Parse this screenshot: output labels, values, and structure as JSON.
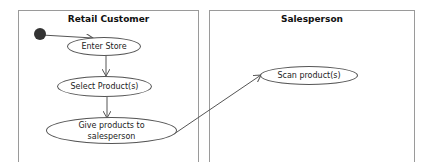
{
  "diagram": {
    "type": "UML activity diagram with swimlanes",
    "lanes": [
      {
        "id": "retail-customer",
        "title": "Retail Customer"
      },
      {
        "id": "salesperson",
        "title": "Salesperson"
      }
    ],
    "nodes": [
      {
        "id": "start",
        "kind": "initial",
        "lane": "retail-customer"
      },
      {
        "id": "enter-store",
        "label": "Enter Store",
        "lane": "retail-customer"
      },
      {
        "id": "select-products",
        "label": "Select Product(s)",
        "lane": "retail-customer"
      },
      {
        "id": "give-products",
        "label": "Give products to salesperson",
        "lane": "retail-customer"
      },
      {
        "id": "scan-products",
        "label": "Scan product(s)",
        "lane": "salesperson"
      }
    ],
    "edges": [
      {
        "from": "start",
        "to": "enter-store"
      },
      {
        "from": "enter-store",
        "to": "select-products"
      },
      {
        "from": "select-products",
        "to": "give-products"
      },
      {
        "from": "give-products",
        "to": "scan-products"
      }
    ],
    "colors": {
      "line": "#555555",
      "lane_border": "#9a9a9a",
      "initial_fill": "#333333"
    }
  }
}
